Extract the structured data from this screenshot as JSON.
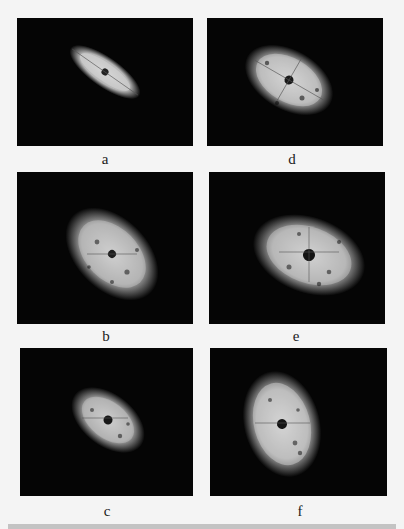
{
  "figure": {
    "panels": [
      {
        "id": "a",
        "label": "a",
        "shape": "narrow-ellipse",
        "orientation_deg": 35,
        "column": "left",
        "row": 1
      },
      {
        "id": "d",
        "label": "d",
        "shape": "ellipse",
        "orientation_deg": 30,
        "column": "right",
        "row": 1
      },
      {
        "id": "b",
        "label": "b",
        "shape": "ellipse",
        "orientation_deg": 40,
        "column": "left",
        "row": 2
      },
      {
        "id": "e",
        "label": "e",
        "shape": "wide-ellipse",
        "orientation_deg": 20,
        "column": "right",
        "row": 2
      },
      {
        "id": "c",
        "label": "c",
        "shape": "compact-ellipse",
        "orientation_deg": 35,
        "column": "left",
        "row": 3
      },
      {
        "id": "f",
        "label": "f",
        "shape": "tall-ellipse",
        "orientation_deg": -20,
        "column": "right",
        "row": 3
      }
    ],
    "colors": {
      "panel_background": "#050505",
      "pattern": "#d9d9d9",
      "page_background": "#f4f4f4"
    }
  }
}
